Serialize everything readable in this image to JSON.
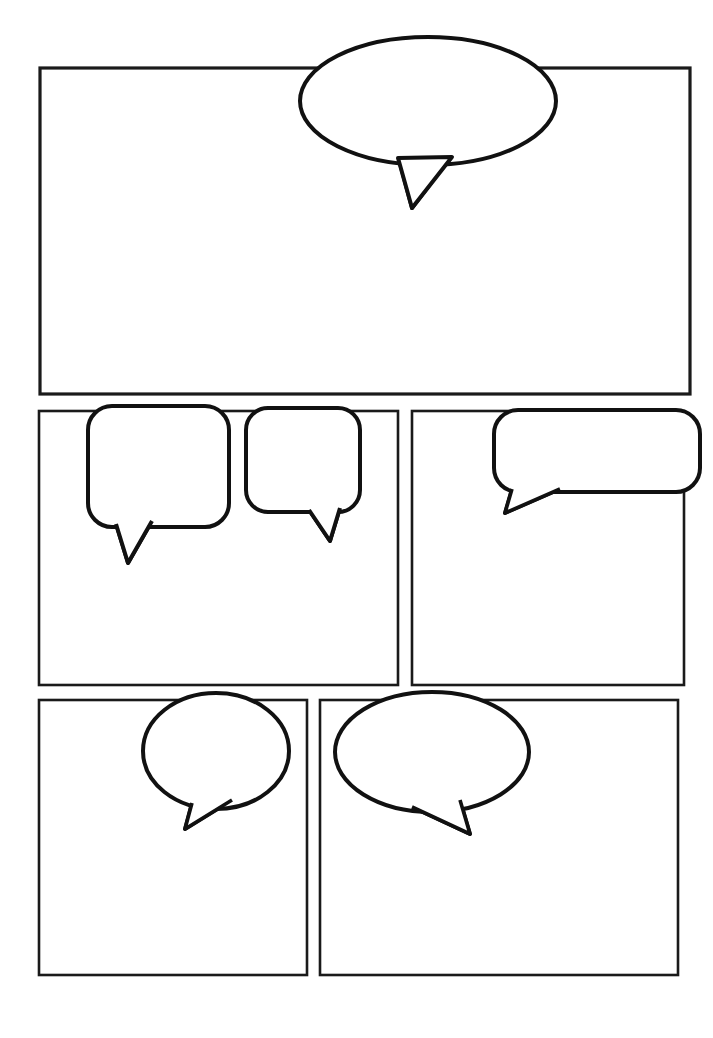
{
  "page": {
    "width": 713,
    "height": 1038,
    "background_color": "#ffffff",
    "ink_color": "#111111",
    "panel_fill": "#ffffff",
    "panel_count": 5,
    "balloon_count": 6,
    "rows": 3
  },
  "panels": [
    {
      "id": "panel-1",
      "label": "Panel 1",
      "row": 1,
      "column": 1,
      "x": 40,
      "y": 68,
      "width": 650,
      "height": 326,
      "stroke_width": 3.2,
      "shape": "rectangle"
    },
    {
      "id": "panel-2",
      "label": "Panel 2",
      "row": 2,
      "column": 1,
      "x": 39,
      "y": 411,
      "width": 359,
      "height": 274,
      "stroke_width": 2.6,
      "shape": "rectangle"
    },
    {
      "id": "panel-3",
      "label": "Panel 3",
      "row": 2,
      "column": 2,
      "x": 412,
      "y": 411,
      "width": 272,
      "height": 274,
      "stroke_width": 2.6,
      "shape": "rectangle"
    },
    {
      "id": "panel-4",
      "label": "Panel 4",
      "row": 3,
      "column": 1,
      "x": 39,
      "y": 700,
      "width": 268,
      "height": 275,
      "stroke_width": 2.6,
      "shape": "rectangle"
    },
    {
      "id": "panel-5",
      "label": "Panel 5",
      "row": 3,
      "column": 2,
      "x": 320,
      "y": 700,
      "width": 358,
      "height": 275,
      "stroke_width": 2.6,
      "shape": "rectangle"
    }
  ],
  "balloons": [
    {
      "id": "balloon-1",
      "label": "Speech Balloon 1",
      "panel": "panel-1",
      "shape": "ellipse",
      "text": "",
      "placeholder": "",
      "cx": 428,
      "cy": 101,
      "rx": 128,
      "ry": 64,
      "stroke_width": 4,
      "tail": {
        "base_left_x": 398,
        "base_left_y": 158,
        "base_right_x": 452,
        "base_right_y": 157,
        "tip_x": 412,
        "tip_y": 208
      }
    },
    {
      "id": "balloon-2",
      "label": "Speech Balloon 2",
      "panel": "panel-2",
      "shape": "rounded-rectangle",
      "text": "",
      "placeholder": "",
      "x": 88,
      "y": 406,
      "width": 141,
      "height": 121,
      "corner_radius": 24,
      "stroke_width": 4,
      "tail": {
        "base_left_x": 116,
        "base_left_y": 524,
        "base_right_x": 152,
        "base_right_y": 521,
        "tip_x": 128,
        "tip_y": 563
      }
    },
    {
      "id": "balloon-3",
      "label": "Speech Balloon 3",
      "panel": "panel-2",
      "shape": "rounded-rectangle",
      "text": "",
      "placeholder": "",
      "x": 246,
      "y": 408,
      "width": 114,
      "height": 104,
      "corner_radius": 22,
      "stroke_width": 4,
      "tail": {
        "base_left_x": 309,
        "base_left_y": 510,
        "base_right_x": 340,
        "base_right_y": 508,
        "tip_x": 330,
        "tip_y": 541
      }
    },
    {
      "id": "balloon-4",
      "label": "Speech Balloon 4",
      "panel": "panel-3",
      "shape": "rounded-rectangle",
      "text": "",
      "placeholder": "",
      "x": 494,
      "y": 410,
      "width": 206,
      "height": 82,
      "corner_radius": 24,
      "stroke_width": 4,
      "tail": {
        "base_left_x": 512,
        "base_left_y": 489,
        "base_right_x": 560,
        "base_right_y": 489,
        "tip_x": 505,
        "tip_y": 513
      }
    },
    {
      "id": "balloon-5",
      "label": "Speech Balloon 5",
      "panel": "panel-4",
      "shape": "ellipse",
      "text": "",
      "placeholder": "",
      "cx": 216,
      "cy": 751,
      "rx": 73,
      "ry": 58,
      "stroke_width": 4,
      "tail": {
        "base_left_x": 192,
        "base_left_y": 803,
        "base_right_x": 232,
        "base_right_y": 800,
        "tip_x": 185,
        "tip_y": 829
      }
    },
    {
      "id": "balloon-6",
      "label": "Speech Balloon 6",
      "panel": "panel-5",
      "shape": "ellipse",
      "text": "",
      "placeholder": "",
      "cx": 432,
      "cy": 752,
      "rx": 97,
      "ry": 60,
      "stroke_width": 4,
      "tail": {
        "base_left_x": 412,
        "base_left_y": 807,
        "base_right_x": 460,
        "base_right_y": 800,
        "tip_x": 470,
        "tip_y": 834
      }
    }
  ]
}
